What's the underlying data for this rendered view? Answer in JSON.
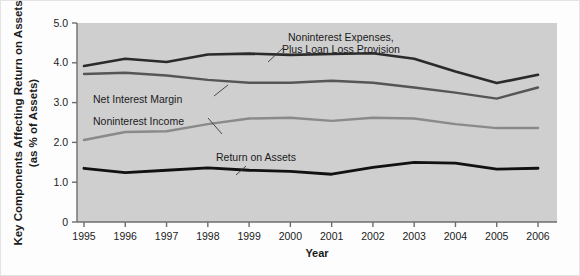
{
  "chart_data": {
    "type": "line",
    "title": "",
    "xlabel": "Year",
    "ylabel": "Key Components Affecting Return on Assets (as % of Assets)",
    "ylabel_line1": "Key Components Affecting Return on Assets",
    "ylabel_line2": "(as % of Assets)",
    "categories": [
      "1995",
      "1996",
      "1997",
      "1998",
      "1999",
      "2000",
      "2001",
      "2002",
      "2003",
      "2004",
      "2005",
      "2006"
    ],
    "x": [
      1995,
      1996,
      1997,
      1998,
      1999,
      2000,
      2001,
      2002,
      2003,
      2004,
      2005,
      2006
    ],
    "xlim": [
      1995,
      2006
    ],
    "ylim": [
      0,
      5.0
    ],
    "yticks": [
      "0",
      "1.0",
      "2.0",
      "3.0",
      "4.0",
      "5.0"
    ],
    "ytick_values": [
      0,
      1.0,
      2.0,
      3.0,
      4.0,
      5.0
    ],
    "grid": false,
    "legend_position": "inline-annotations",
    "series": [
      {
        "name": "Noninterest Expenses, Plus Loan Loss Provision",
        "label_line1": "Noninterest Expenses,",
        "label_line2": "Plus Loan Loss Provision",
        "color": "#2b2b2b",
        "width": 2.6,
        "values": [
          3.92,
          4.1,
          4.02,
          4.21,
          4.23,
          4.2,
          4.22,
          4.24,
          4.1,
          3.78,
          3.49,
          3.7
        ]
      },
      {
        "name": "Net Interest Margin",
        "label_line1": "Net Interest Margin",
        "label_line2": "",
        "color": "#565656",
        "width": 2.4,
        "values": [
          3.72,
          3.75,
          3.68,
          3.57,
          3.5,
          3.5,
          3.55,
          3.5,
          3.38,
          3.25,
          3.1,
          3.38
        ]
      },
      {
        "name": "Noninterest Income",
        "label_line1": "Noninterest Income",
        "label_line2": "",
        "color": "#8a8a8a",
        "width": 2.4,
        "values": [
          2.06,
          2.26,
          2.28,
          2.46,
          2.6,
          2.62,
          2.54,
          2.62,
          2.6,
          2.46,
          2.36,
          2.36
        ]
      },
      {
        "name": "Return on Assets",
        "label_line1": "Return on Assets",
        "label_line2": "",
        "color": "#111111",
        "width": 2.8,
        "values": [
          1.35,
          1.24,
          1.3,
          1.36,
          1.3,
          1.27,
          1.2,
          1.37,
          1.5,
          1.48,
          1.33,
          1.35
        ]
      }
    ],
    "annotations": [
      {
        "text": "Noninterest Expenses, Plus Loan Loss Provision",
        "x": 2001,
        "y": 4.9
      },
      {
        "text": "Net Interest Margin",
        "x": 1996,
        "y": 3.1
      },
      {
        "text": "Noninterest Income",
        "x": 1996,
        "y": 2.75
      },
      {
        "text": "Return on Assets",
        "x": 1999.6,
        "y": 1.72
      }
    ]
  },
  "axis": {
    "x_title": "Year",
    "y_title_line1": "Key Components Affecting Return on Assets",
    "y_title_line2": "(as % of Assets)",
    "y_ticks": [
      "5.0",
      "4.0",
      "3.0",
      "2.0",
      "1.0",
      "0"
    ],
    "x_ticks": [
      "1995",
      "1996",
      "1997",
      "1998",
      "1999",
      "2000",
      "2001",
      "2002",
      "2003",
      "2004",
      "2005",
      "2006"
    ]
  },
  "labels": {
    "noninterest_expenses_l1": "Noninterest Expenses,",
    "noninterest_expenses_l2": "Plus Loan Loss Provision",
    "net_interest_margin": "Net Interest Margin",
    "noninterest_income": "Noninterest Income",
    "return_on_assets": "Return on Assets"
  },
  "colors": {
    "plot_background": "#cfcfcf",
    "figure_background": "#fdfdfd",
    "axis": "#6d6d6d",
    "series_expenses": "#2b2b2b",
    "series_margin": "#565656",
    "series_income": "#8a8a8a",
    "series_roa": "#111111"
  }
}
